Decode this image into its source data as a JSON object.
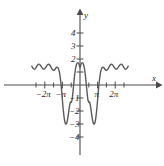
{
  "figure": {
    "background_color": "#ffffff",
    "curve_color": "#5a5a5a",
    "axis_color": "#4a4a4a",
    "text_color": "#2b2b2b"
  },
  "axis_labels": {
    "x": "x",
    "y": "y"
  },
  "x_tick_labels": [
    {
      "text": "−2π",
      "value": -6.2832
    },
    {
      "text": "−π",
      "value": -3.1416
    },
    {
      "text": "π",
      "value": 3.1416
    },
    {
      "text": "2π",
      "value": 6.2832
    }
  ],
  "y_tick_labels": [
    {
      "text": "4",
      "value": 4
    },
    {
      "text": "3",
      "value": 3
    },
    {
      "text": "2",
      "value": 2
    },
    {
      "text": "−1",
      "value": -1
    },
    {
      "text": "−2",
      "value": -2
    },
    {
      "text": "−3",
      "value": -3
    },
    {
      "text": "−4",
      "value": -4
    }
  ],
  "chart_data": {
    "type": "line",
    "title": "",
    "subtitle": "",
    "xlabel": "x",
    "ylabel": "y",
    "xlim": [
      -8.6,
      8.6
    ],
    "ylim": [
      -4.6,
      4.6
    ],
    "grid": false,
    "legend": null,
    "x_tick_values": [
      -6.2832,
      -3.1416,
      3.1416,
      6.2832
    ],
    "x_minor_tick_step": 1.5708,
    "y_tick_values": [
      4,
      3,
      2,
      1,
      -1,
      -2,
      -3,
      -4
    ],
    "series": [
      {
        "name": "y",
        "color": "#5a5a5a",
        "x": [
          -8.6,
          -8.4,
          -8.2,
          -8.0,
          -7.8,
          -7.6,
          -7.4,
          -7.2,
          -7.0,
          -6.8,
          -6.6,
          -6.4,
          -6.2,
          -6.0,
          -5.8,
          -5.6,
          -5.4,
          -5.2,
          -5.0,
          -4.8,
          -4.6,
          -4.4,
          -4.2,
          -4.0,
          -3.8,
          -3.6,
          -3.4,
          -3.2,
          -3.0,
          -2.8,
          -2.6,
          -2.4,
          -2.2,
          -2.0,
          -1.8,
          -1.7,
          -1.6,
          -1.4,
          -1.2,
          -1.0,
          -0.8,
          -0.6,
          -0.4,
          -0.2,
          0.0,
          0.2,
          0.4,
          0.6,
          0.8,
          1.0,
          1.2,
          1.4,
          1.6,
          1.7,
          1.8,
          2.0,
          2.2,
          2.4,
          2.6,
          2.8,
          3.0,
          3.2,
          3.4,
          3.6,
          3.8,
          4.0,
          4.2,
          4.4,
          4.6,
          4.8,
          5.0,
          5.2,
          5.4,
          5.6,
          5.8,
          6.0,
          6.2,
          6.4,
          6.6,
          6.8,
          7.0,
          7.2,
          7.4,
          7.6,
          7.8,
          8.0,
          8.2,
          8.4,
          8.6
        ],
        "y": [
          1.45,
          1.3,
          1.22,
          1.25,
          1.38,
          1.52,
          1.6,
          1.58,
          1.48,
          1.34,
          1.24,
          1.22,
          1.3,
          1.44,
          1.56,
          1.6,
          1.54,
          1.4,
          1.24,
          1.14,
          1.15,
          1.25,
          1.35,
          1.36,
          1.2,
          0.8,
          0.1,
          -0.85,
          -1.85,
          -2.6,
          -2.97,
          -2.95,
          -2.6,
          -2.0,
          -1.45,
          -1.3,
          -1.35,
          -1.1,
          -0.3,
          0.6,
          1.25,
          1.62,
          1.72,
          1.62,
          1.35,
          1.62,
          1.72,
          1.62,
          1.25,
          0.6,
          -0.3,
          -1.1,
          -1.35,
          -1.3,
          -1.45,
          -2.0,
          -2.6,
          -2.95,
          -2.97,
          -2.6,
          -1.85,
          -0.85,
          0.1,
          0.8,
          1.2,
          1.36,
          1.35,
          1.25,
          1.15,
          1.14,
          1.24,
          1.4,
          1.54,
          1.6,
          1.56,
          1.44,
          1.3,
          1.22,
          1.24,
          1.34,
          1.48,
          1.58,
          1.6,
          1.52,
          1.38,
          1.25,
          1.22,
          1.3,
          1.45
        ]
      }
    ]
  }
}
